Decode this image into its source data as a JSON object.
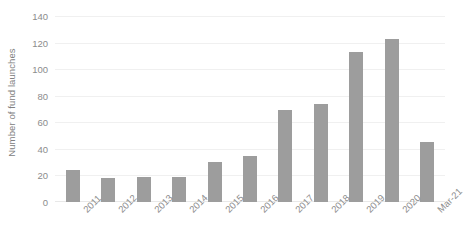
{
  "chart_data": {
    "type": "bar",
    "title": "",
    "subtitle": "",
    "xlabel": "",
    "ylabel": "Number of fund launches",
    "categories": [
      "2011",
      "2012",
      "2013",
      "2014",
      "2015",
      "2016",
      "2017",
      "2018",
      "2019",
      "2020",
      "Mar-21"
    ],
    "values": [
      24,
      18,
      19,
      19,
      30,
      35,
      69,
      74,
      113,
      123,
      45
    ],
    "ylim": [
      0,
      140
    ],
    "yticks": [
      0,
      20,
      40,
      60,
      80,
      100,
      120,
      140
    ],
    "ytick_labels": [
      "0",
      "20",
      "40",
      "60",
      "80",
      "100",
      "120",
      "140"
    ],
    "grid": true,
    "grid_axis": "y",
    "legend": false,
    "legend_position": "none",
    "bar_color": "#9d9d9d",
    "gridline_color": "#f0f0f0",
    "text_color": "#8c8c8c",
    "background_color": "#ffffff",
    "xtick_rotation": -45,
    "annotations": []
  }
}
